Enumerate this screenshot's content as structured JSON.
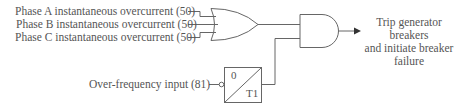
{
  "diagram": {
    "type": "logic-diagram",
    "inputs": [
      {
        "id": "phase_a",
        "label": "Phase A instantaneous overcurrent (50)"
      },
      {
        "id": "phase_b",
        "label": "Phase B instantaneous overcurrent (50)"
      },
      {
        "id": "phase_c",
        "label": "Phase C instantaneous overcurrent (50)"
      },
      {
        "id": "over_freq",
        "label": "Over-frequency input (81)"
      }
    ],
    "gates": [
      {
        "id": "or_gate",
        "kind": "OR",
        "inputs": [
          "phase_a",
          "phase_b",
          "phase_c"
        ]
      },
      {
        "id": "timer",
        "kind": "TIMER",
        "pickup": "0",
        "dropout": "T1",
        "input": "over_freq",
        "input_inverted": true
      },
      {
        "id": "and_gate",
        "kind": "AND",
        "inputs": [
          "or_gate",
          "timer"
        ]
      }
    ],
    "timer": {
      "top_label": "0",
      "bottom_label": "T1"
    },
    "output": {
      "lines": [
        "Trip generator",
        "breakers",
        "and initiate breaker",
        "failure"
      ]
    },
    "colors": {
      "line": "#666666",
      "text": "#555555"
    }
  }
}
